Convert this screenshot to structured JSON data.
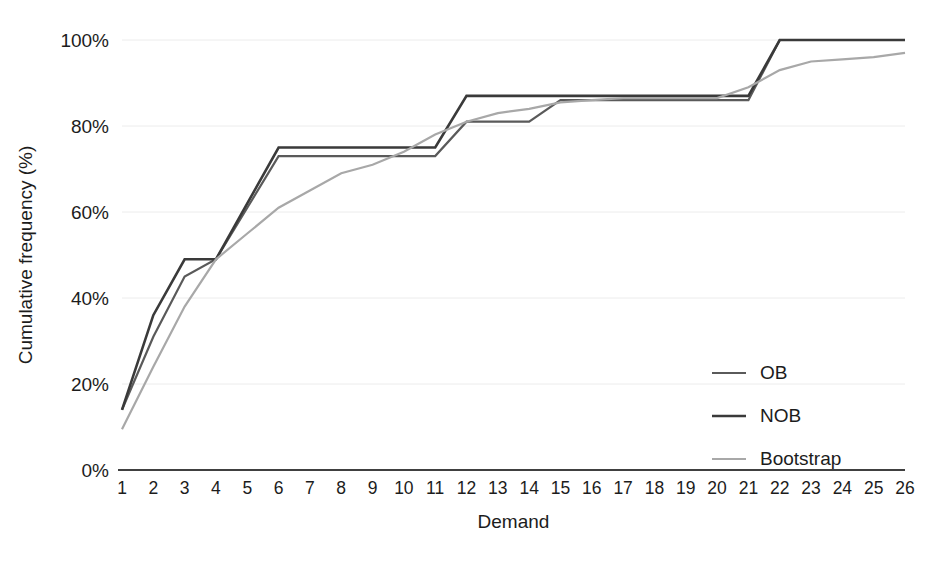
{
  "chart_data": {
    "type": "line",
    "title": "",
    "subtitle": "",
    "xlabel": "Demand",
    "ylabel": "Cumulative frequency (%)",
    "x": [
      1,
      2,
      3,
      4,
      5,
      6,
      7,
      8,
      9,
      10,
      11,
      12,
      13,
      14,
      15,
      16,
      17,
      18,
      19,
      20,
      21,
      22,
      23,
      24,
      25,
      26
    ],
    "xtick_labels": [
      "1",
      "2",
      "3",
      "4",
      "5",
      "6",
      "7",
      "8",
      "9",
      "10",
      "11",
      "12",
      "13",
      "14",
      "15",
      "16",
      "17",
      "18",
      "19",
      "20",
      "21",
      "22",
      "23",
      "24",
      "25",
      "26"
    ],
    "ytick_labels": [
      "0%",
      "20%",
      "40%",
      "60%",
      "80%",
      "100%"
    ],
    "ytick_values": [
      0,
      20,
      40,
      60,
      80,
      100
    ],
    "xlim": [
      1,
      26
    ],
    "ylim": [
      0,
      100
    ],
    "grid": "horizontal",
    "legend_position": "inside-right",
    "series": [
      {
        "name": "OB",
        "color": "#5a5a5a",
        "width": 2.2,
        "values": [
          14,
          31,
          45,
          49,
          61,
          73,
          73,
          73,
          73,
          73,
          73,
          81,
          81,
          81,
          86,
          86,
          86,
          86,
          86,
          86,
          86,
          100,
          100,
          100,
          100,
          100
        ]
      },
      {
        "name": "NOB",
        "color": "#3a3a3a",
        "width": 2.6,
        "values": [
          14,
          36,
          49,
          49,
          62,
          75,
          75,
          75,
          75,
          75,
          75,
          87,
          87,
          87,
          87,
          87,
          87,
          87,
          87,
          87,
          87,
          100,
          100,
          100,
          100,
          100
        ]
      },
      {
        "name": "Bootstrap",
        "color": "#a8a8a8",
        "width": 2.2,
        "values": [
          9.5,
          24,
          38,
          49,
          55,
          61,
          65,
          69,
          71,
          74,
          78,
          81,
          83,
          84,
          85.5,
          86,
          86.5,
          86.5,
          86.5,
          86.5,
          89,
          93,
          95,
          95.5,
          96,
          97
        ]
      }
    ]
  },
  "legend": {
    "items": [
      {
        "label": "OB",
        "color": "#5a5a5a"
      },
      {
        "label": "NOB",
        "color": "#3a3a3a"
      },
      {
        "label": "Bootstrap",
        "color": "#a8a8a8"
      }
    ]
  }
}
